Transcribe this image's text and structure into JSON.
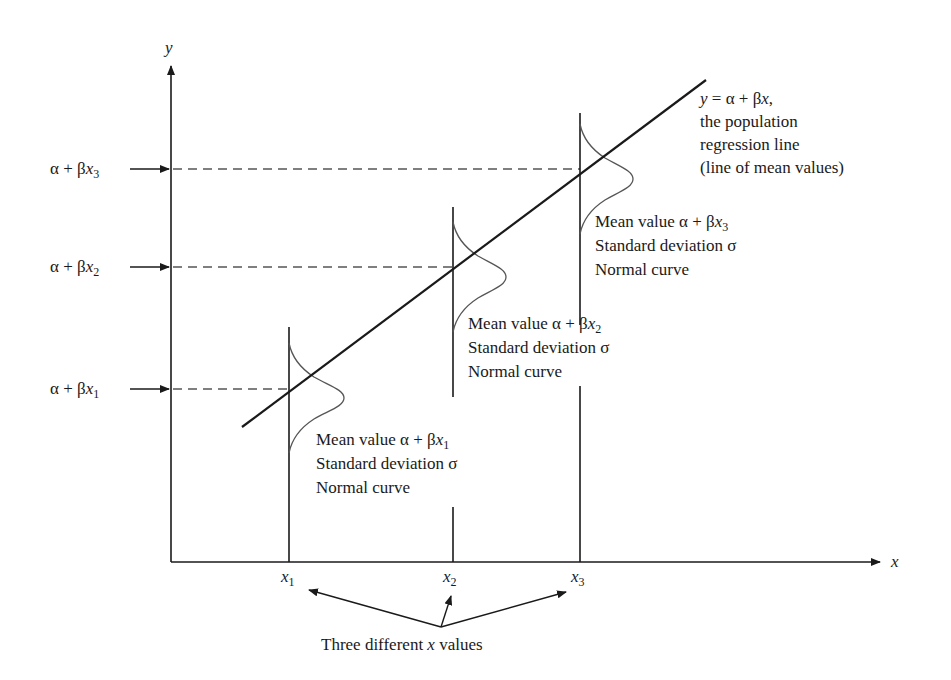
{
  "axes": {
    "y_label": "y",
    "x_label": "x"
  },
  "y_markers": [
    {
      "prefix": "α + β",
      "var": "x",
      "sub": "1"
    },
    {
      "prefix": "α + β",
      "var": "x",
      "sub": "2"
    },
    {
      "prefix": "α + β",
      "var": "x",
      "sub": "3"
    }
  ],
  "x_ticks": [
    {
      "var": "x",
      "sub": "1"
    },
    {
      "var": "x",
      "sub": "2"
    },
    {
      "var": "x",
      "sub": "3"
    }
  ],
  "regression_label": {
    "eq_y": "y",
    "eq_mid": " = α + β",
    "eq_x": "x",
    "eq_end": ",",
    "line2": "the population",
    "line3": "regression line",
    "line4": "(line of mean values)"
  },
  "distributions": [
    {
      "mean_prefix": "Mean value α + β",
      "mean_var": "x",
      "mean_sub": "1",
      "sd": "Standard deviation σ",
      "shape": "Normal curve"
    },
    {
      "mean_prefix": "Mean value α + β",
      "mean_var": "x",
      "mean_sub": "2",
      "sd": "Standard deviation σ",
      "shape": "Normal curve"
    },
    {
      "mean_prefix": "Mean value α + β",
      "mean_var": "x",
      "mean_sub": "3",
      "sd": "Standard deviation σ",
      "shape": "Normal curve"
    }
  ],
  "caption": {
    "pre": "Three different ",
    "var": "x",
    "post": " values"
  },
  "colors": {
    "ink": "#1a1a1a",
    "dash": "#555555",
    "curve": "#555555"
  }
}
